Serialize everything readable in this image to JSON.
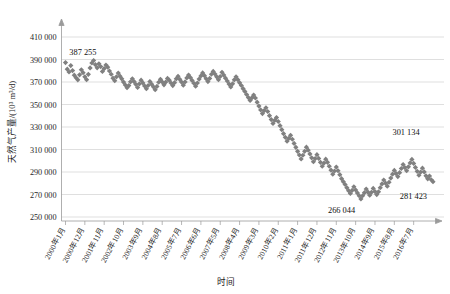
{
  "chart_data": {
    "type": "scatter",
    "title": "",
    "xlabel": "时间",
    "ylabel": "天然气产量/(10³ m³/d)",
    "ylim": [
      250000,
      410000
    ],
    "ytick_values": [
      250000,
      270000,
      290000,
      310000,
      330000,
      350000,
      370000,
      390000,
      410000
    ],
    "ytick_labels": [
      "250 000",
      "270 000",
      "290 000",
      "310 000",
      "330 000",
      "350 000",
      "370 000",
      "390 000",
      "410 000"
    ],
    "grid": true,
    "legend": "none",
    "marker": "diamond",
    "series_color": "#808080",
    "x_categories": [
      "2000年1月",
      "2000年12月",
      "2001年11月",
      "2002年10月",
      "2003年9月",
      "2004年8月",
      "2005年7月",
      "2006年6月",
      "2007年5月",
      "2008年4月",
      "2009年3月",
      "2010年2月",
      "2011年1月",
      "2011年12月",
      "2012年11月",
      "2013年10月",
      "2014年9月",
      "2015年8月",
      "2016年7月"
    ],
    "x_tick_interval_months": 11,
    "x_start": "2000年1月",
    "x_end": "2016年7月",
    "annotations": [
      {
        "label": "387 255",
        "value": 387255,
        "index": 1,
        "position": "above-left"
      },
      {
        "label": "266 044",
        "value": 266044,
        "index": 157,
        "position": "below"
      },
      {
        "label": "301 134",
        "value": 301134,
        "index": 188,
        "position": "above-right"
      },
      {
        "label": "281 423",
        "value": 281423,
        "index": 199,
        "position": "below-right"
      }
    ],
    "values": [
      387255,
      381400,
      378900,
      384600,
      380200,
      376100,
      373800,
      371900,
      376400,
      380900,
      378300,
      374600,
      372100,
      376800,
      382500,
      386900,
      389100,
      385400,
      382600,
      386200,
      383700,
      379400,
      381900,
      385100,
      383200,
      379800,
      376900,
      373400,
      371100,
      374600,
      377900,
      375200,
      372800,
      369900,
      367400,
      364900,
      366800,
      370200,
      372900,
      370400,
      367900,
      365100,
      368300,
      371600,
      369200,
      366500,
      364100,
      366900,
      370400,
      368100,
      365700,
      363200,
      366100,
      369800,
      372400,
      370100,
      367500,
      369900,
      373200,
      371600,
      369100,
      366800,
      369400,
      372800,
      375100,
      372400,
      369900,
      367200,
      370100,
      373600,
      376200,
      373900,
      371400,
      368900,
      366300,
      369100,
      372600,
      375400,
      378100,
      375600,
      372900,
      370400,
      373200,
      376900,
      379400,
      377100,
      374600,
      372100,
      374900,
      378600,
      376200,
      373400,
      370900,
      368200,
      365600,
      368400,
      371900,
      374600,
      372100,
      369400,
      366900,
      364100,
      361600,
      358900,
      356200,
      353600,
      355900,
      358400,
      355800,
      352100,
      348600,
      345200,
      341900,
      344600,
      347100,
      343800,
      340100,
      336600,
      333200,
      335900,
      338400,
      334900,
      331200,
      327600,
      324100,
      320800,
      317400,
      319900,
      322600,
      319100,
      315400,
      311900,
      308400,
      305100,
      301600,
      304900,
      308400,
      312100,
      309400,
      306100,
      302600,
      299100,
      301900,
      305400,
      302100,
      298600,
      295100,
      297900,
      301400,
      298600,
      295100,
      291600,
      288100,
      290900,
      294400,
      291100,
      287600,
      284100,
      281400,
      278900,
      276100,
      273400,
      270900,
      273600,
      276900,
      274100,
      271400,
      268900,
      266044,
      268900,
      271600,
      274900,
      272100,
      269400,
      271900,
      275400,
      272600,
      269900,
      272400,
      276100,
      279400,
      282900,
      280100,
      277400,
      280900,
      284600,
      288100,
      291400,
      288600,
      285900,
      289400,
      293100,
      296600,
      293900,
      291100,
      294600,
      298100,
      301134,
      297600,
      294100,
      290600,
      287100,
      289900,
      293400,
      290100,
      286600,
      283900,
      286400,
      283100,
      281423
    ]
  }
}
